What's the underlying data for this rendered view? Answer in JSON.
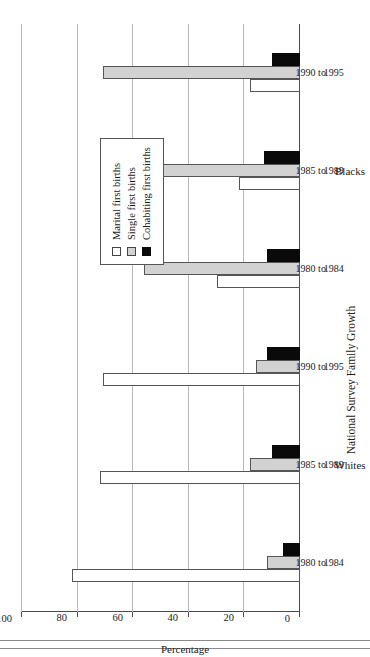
{
  "chart_data": {
    "type": "bar",
    "orientation": "horizontal",
    "title": "National Survey Family Growth",
    "xlabel": "",
    "ylabel": "Percentage",
    "ylim": [
      0,
      100
    ],
    "yticks": [
      0,
      20,
      40,
      60,
      80,
      100
    ],
    "ytick_labels": [
      "0",
      "20",
      "40",
      "60",
      "80",
      "100"
    ],
    "grid": true,
    "legend_position": "upper-left",
    "group_labels": [
      "Whites",
      "Blacks"
    ],
    "categories": [
      {
        "group": "Whites",
        "line1": "1980 to",
        "line2": "1984"
      },
      {
        "group": "Whites",
        "line1": "1985 to",
        "line2": "1989"
      },
      {
        "group": "Whites",
        "line1": "1990 to",
        "line2": "1995"
      },
      {
        "group": "Blacks",
        "line1": "1980 to",
        "line2": "1984"
      },
      {
        "group": "Blacks",
        "line1": "1985 to",
        "line2": "1989"
      },
      {
        "group": "Blacks",
        "line1": "1990 to",
        "line2": "1995"
      }
    ],
    "series": [
      {
        "name": "Marital first births",
        "color": "#ffffff",
        "values": [
          82,
          72,
          71,
          30,
          22,
          18
        ]
      },
      {
        "name": "Single first births",
        "color": "#d2d2d2",
        "values": [
          12,
          18,
          16,
          56,
          64,
          71
        ]
      },
      {
        "name": "Cohabiting first births",
        "color": "#0a0a0a",
        "values": [
          6,
          10,
          12,
          12,
          13,
          10
        ]
      }
    ]
  },
  "legend": {
    "items": [
      {
        "key": "marital",
        "label": "Marital first births"
      },
      {
        "key": "single",
        "label": "Single first births"
      },
      {
        "key": "cohab",
        "label": "Cohabiting first births"
      }
    ]
  },
  "axis": {
    "title": "Percentage",
    "ticks": [
      "100",
      "80",
      "60",
      "40",
      "20",
      "0"
    ]
  }
}
